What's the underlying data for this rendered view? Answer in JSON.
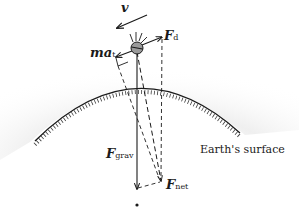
{
  "diagram": {
    "title": "",
    "labels": {
      "velocity": "v",
      "drag_force": {
        "symbol": "F",
        "subscript": "d"
      },
      "tangential_force": {
        "symbol": "ma",
        "subscript": "t"
      },
      "gravity_force": {
        "symbol": "F",
        "subscript": "grav"
      },
      "net_force": {
        "symbol": "F",
        "subscript": "net"
      },
      "surface": "Earth's surface"
    },
    "colors": {
      "ink": "#1a1a1a",
      "satellite_fill": "#9a9a9a",
      "shade": "#e6e6e6"
    },
    "elements": [
      {
        "id": "satellite",
        "type": "circle",
        "center": [
          137,
          48
        ]
      },
      {
        "id": "v-arrow",
        "type": "solid-arrow",
        "from": [
          147,
          15
        ],
        "to": [
          117,
          28
        ]
      },
      {
        "id": "Fd-arrow",
        "type": "solid-arrow",
        "from": [
          142,
          45
        ],
        "to": [
          162,
          37
        ]
      },
      {
        "id": "mat-arrow",
        "type": "solid-arrow",
        "from": [
          132,
          51
        ],
        "to": [
          116,
          57
        ]
      },
      {
        "id": "Fgrav-arrow",
        "type": "solid-arrow",
        "from": [
          137,
          52
        ],
        "to": [
          137,
          188
        ]
      },
      {
        "id": "Fnet-arrow",
        "type": "dashed-arrow",
        "from": [
          137,
          52
        ],
        "to": [
          161,
          181
        ]
      },
      {
        "id": "earth-center",
        "type": "dot",
        "center": [
          137,
          205
        ]
      }
    ]
  }
}
